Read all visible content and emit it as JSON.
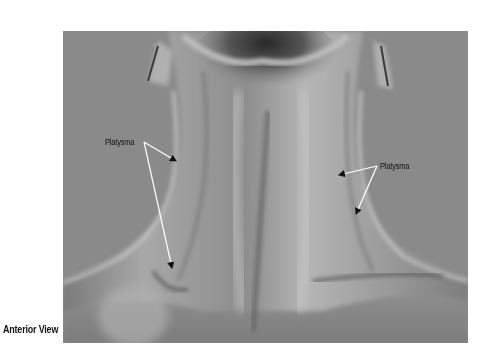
{
  "figure": {
    "caption": "Anterior View",
    "labels": [
      {
        "id": "platysma-left",
        "text": "Platysma",
        "x": 105,
        "y": 137,
        "arrows": [
          {
            "from": [
              144,
              142
            ],
            "to": [
              176,
              161
            ]
          },
          {
            "from": [
              144,
              142
            ],
            "to": [
              172,
              268
            ]
          }
        ]
      },
      {
        "id": "platysma-right",
        "text": "Platysma",
        "x": 380,
        "y": 161,
        "arrows": [
          {
            "from": [
              377,
              166
            ],
            "to": [
              339,
              175
            ]
          },
          {
            "from": [
              377,
              166
            ],
            "to": [
              356,
              214
            ]
          }
        ]
      }
    ],
    "colors": {
      "background_gray": "#8a8a8a",
      "label_text": "#111111",
      "arrow_stroke": "#ffffff",
      "arrow_head": "#111111"
    }
  }
}
